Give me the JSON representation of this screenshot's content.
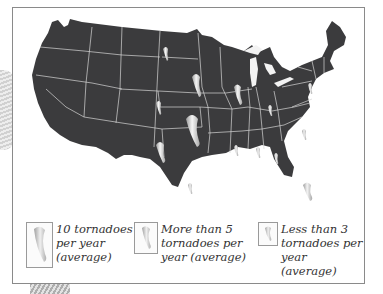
{
  "figure": {
    "type": "illustrated map",
    "map_fill_color": "#3b3b3d",
    "border_color": "#d8d8d8",
    "tornado_symbol_color": "#e8e8e8"
  },
  "legend": {
    "items": [
      {
        "label": "10 tornadoes\nper year\n(average)",
        "size": "large"
      },
      {
        "label": "More than 5\ntornadoes per\nyear (average)",
        "size": "medium"
      },
      {
        "label": "Less than 3\ntornadoes per\nyear (average)",
        "size": "small"
      }
    ]
  },
  "tornado_markers": [
    {
      "region": "North Dakota",
      "size": "small"
    },
    {
      "region": "South Dakota / Nebraska",
      "size": "medium"
    },
    {
      "region": "Iowa / Illinois",
      "size": "medium"
    },
    {
      "region": "Colorado",
      "size": "small"
    },
    {
      "region": "Kansas / Oklahoma",
      "size": "large"
    },
    {
      "region": "Texas (north)",
      "size": "medium"
    },
    {
      "region": "Texas (south)",
      "size": "small"
    },
    {
      "region": "Missouri / Arkansas",
      "size": "small"
    },
    {
      "region": "Indiana",
      "size": "small"
    },
    {
      "region": "Pennsylvania",
      "size": "small"
    },
    {
      "region": "Virginia / North Carolina",
      "size": "small"
    },
    {
      "region": "Louisiana",
      "size": "small"
    },
    {
      "region": "Alabama",
      "size": "small"
    },
    {
      "region": "Florida",
      "size": "medium"
    }
  ]
}
